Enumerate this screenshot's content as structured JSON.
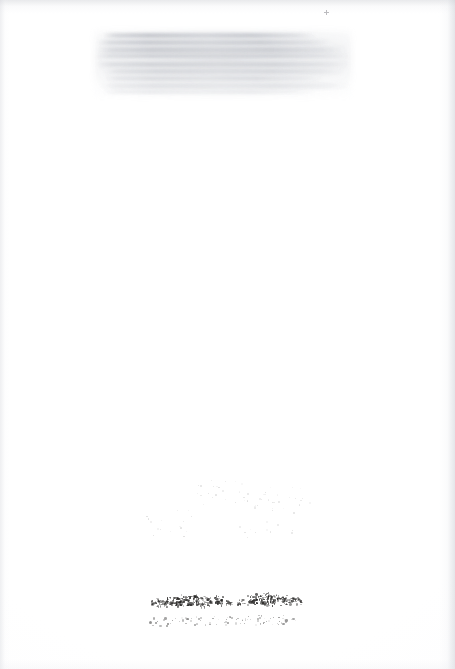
{
  "page": {
    "kind": "scanned-blank-page",
    "width": 455,
    "height": 669,
    "background_color": "#ffffff",
    "paper_tone": "#fdfdfe",
    "caption": ""
  },
  "artifacts": {
    "ghost_block": {
      "name": "bleed-through-text-block",
      "description": "Faint grey rectangular ghost of printed text bleeding through from the reverse or facing page",
      "color": "#b7babf",
      "left": 95,
      "top": 31,
      "width": 256,
      "height": 66,
      "line_count": 9,
      "label": ""
    },
    "inscription": {
      "name": "degraded-ink-inscription",
      "description": "Heavily degraded, illegible handwritten or stamped ink mark near the lower centre of the page",
      "color": "#1a1918",
      "left": 148,
      "top": 589,
      "width": 158,
      "height": 26,
      "legible_text": "",
      "label": ""
    },
    "foxing": {
      "name": "foxing-specks",
      "description": "Scattered faint residual ink and foxing specks",
      "color": "#2d2c2b",
      "label": ""
    },
    "top_mark": {
      "name": "registration-speck",
      "description": "Tiny cross-shaped speck near the top right of the page",
      "color": "#7b7a80",
      "left": 324,
      "top": 10,
      "label": ""
    },
    "scan_edges": {
      "name": "scanner-edge-shadow",
      "description": "Soft grey shadow bands along the page edges from the scanner bed",
      "color": "#cdcfd4",
      "label": ""
    }
  }
}
